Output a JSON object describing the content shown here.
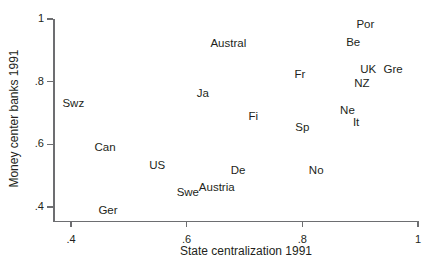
{
  "chart_data": {
    "type": "scatter",
    "title": "",
    "xlabel": "State centralization 1991",
    "ylabel": "Money center banks 1991",
    "xlim": [
      0.37,
      1.0
    ],
    "ylim": [
      0.355,
      1.02
    ],
    "xticks": [
      ".4",
      ".6",
      ".8",
      "1"
    ],
    "xtick_values": [
      0.4,
      0.6,
      0.8,
      1.0
    ],
    "yticks": [
      ".4",
      ".6",
      ".8",
      "1"
    ],
    "ytick_values": [
      0.4,
      0.6,
      0.8,
      1.0
    ],
    "grid": false,
    "legend": null,
    "marker_style": "text-label",
    "points": [
      {
        "label": "Swz",
        "x": 0.404,
        "y": 0.73
      },
      {
        "label": "Can",
        "x": 0.459,
        "y": 0.587
      },
      {
        "label": "US",
        "x": 0.549,
        "y": 0.53
      },
      {
        "label": "Ger",
        "x": 0.464,
        "y": 0.387
      },
      {
        "label": "Ja",
        "x": 0.628,
        "y": 0.762
      },
      {
        "label": "Swe",
        "x": 0.602,
        "y": 0.444
      },
      {
        "label": "Austral",
        "x": 0.672,
        "y": 0.921
      },
      {
        "label": "Fi",
        "x": 0.715,
        "y": 0.686
      },
      {
        "label": "De",
        "x": 0.689,
        "y": 0.514
      },
      {
        "label": "Austria",
        "x": 0.652,
        "y": 0.46
      },
      {
        "label": "Fr",
        "x": 0.796,
        "y": 0.822
      },
      {
        "label": "Sp",
        "x": 0.8,
        "y": 0.651
      },
      {
        "label": "No",
        "x": 0.824,
        "y": 0.514
      },
      {
        "label": "Ne",
        "x": 0.878,
        "y": 0.705
      },
      {
        "label": "It",
        "x": 0.893,
        "y": 0.668
      },
      {
        "label": "NZ",
        "x": 0.903,
        "y": 0.794
      },
      {
        "label": "Be",
        "x": 0.888,
        "y": 0.924
      },
      {
        "label": "Por",
        "x": 0.909,
        "y": 0.981
      },
      {
        "label": "UK",
        "x": 0.914,
        "y": 0.838
      },
      {
        "label": "Gre",
        "x": 0.957,
        "y": 0.838
      }
    ]
  },
  "style": {
    "text_color": "#231f20",
    "axis_color": "#6d6e71",
    "background": "#ffffff"
  }
}
